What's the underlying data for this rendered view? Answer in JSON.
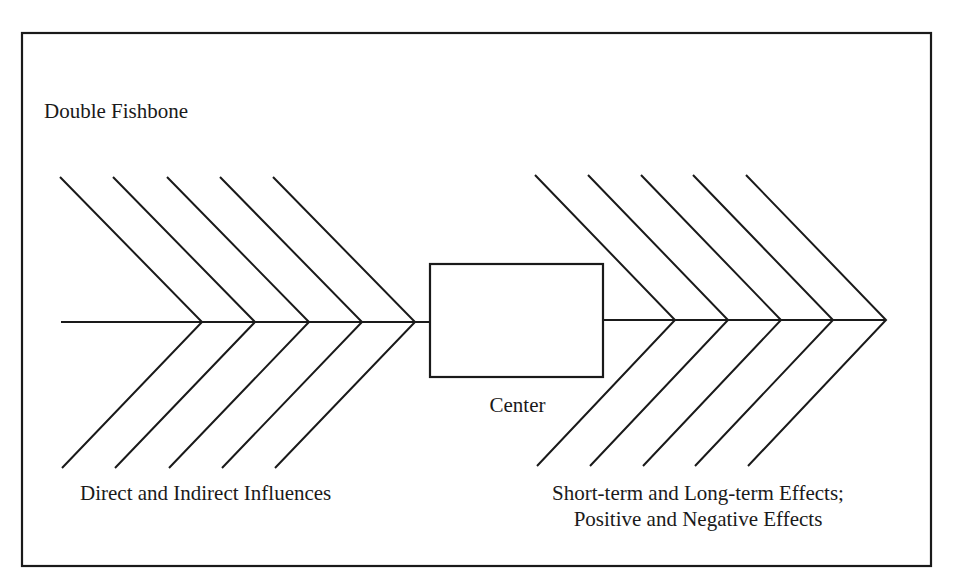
{
  "title": "Double Fishbone",
  "center": {
    "label": "Center"
  },
  "left_side": {
    "label": "Direct and Indirect Influences",
    "bone_count": 5
  },
  "right_side": {
    "label_lines": [
      "Short-term and Long-term Effects;",
      "Positive and Negative Effects"
    ],
    "bone_count": 5
  },
  "colors": {
    "line": "#1a1a1a",
    "background": "#ffffff"
  }
}
